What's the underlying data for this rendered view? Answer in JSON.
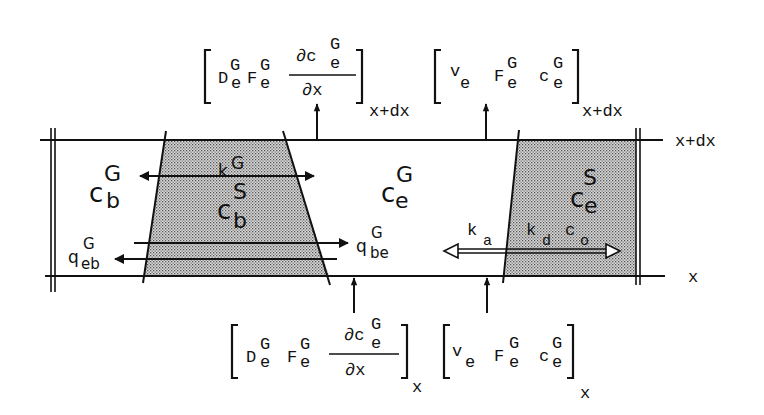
{
  "diagram": {
    "type": "mass-balance control volume (bubble/emulsion phase with solids)",
    "boundaries": {
      "top": "x+dx",
      "bottom": "x"
    },
    "regions": {
      "bubble_gas": {
        "symbol": "c",
        "sup": "G",
        "sub": "b"
      },
      "bubble_solid": {
        "symbol": "c",
        "sup": "S",
        "sub": "b"
      },
      "emulsion_gas": {
        "symbol": "c",
        "sup": "G",
        "sub": "e"
      },
      "emulsion_solid": {
        "symbol": "c",
        "sup": "S",
        "sub": "e"
      }
    },
    "arrows": {
      "kG": {
        "symbol": "k",
        "sup": "G"
      },
      "q_be": {
        "symbol": "q",
        "sup": "G",
        "sub": "be"
      },
      "q_eb": {
        "symbol": "q",
        "sup": "G",
        "sub": "eb"
      },
      "ka": {
        "symbol": "k",
        "sub": "a"
      },
      "kd": {
        "symbol": "k",
        "sub": "d"
      },
      "co": {
        "symbol": "c",
        "sub": "o"
      }
    },
    "fluxes": {
      "top_diffusion": {
        "D": "D",
        "D_sup": "G",
        "D_sub": "e",
        "F": "F",
        "F_sup": "G",
        "F_sub": "e",
        "num": "∂c",
        "num_sup": "G",
        "num_sub": "e",
        "den": "∂x",
        "eval": "x+dx"
      },
      "top_convection": {
        "v": "v",
        "v_sub": "e",
        "F": "F",
        "F_sup": "G",
        "F_sub": "e",
        "c": "c",
        "c_sup": "G",
        "c_sub": "e",
        "eval": "x+dx"
      },
      "bottom_diffusion": {
        "D": "D",
        "D_sup": "G",
        "D_sub": "e",
        "F": "F",
        "F_sup": "G",
        "F_sub": "e",
        "num": "∂c",
        "num_sup": "G",
        "num_sub": "e",
        "den": "∂x",
        "eval": "x"
      },
      "bottom_convection": {
        "v": "v",
        "v_sub": "e",
        "F": "F",
        "F_sup": "G",
        "F_sub": "e",
        "c": "c",
        "c_sup": "G",
        "c_sub": "e",
        "eval": "x"
      }
    }
  }
}
